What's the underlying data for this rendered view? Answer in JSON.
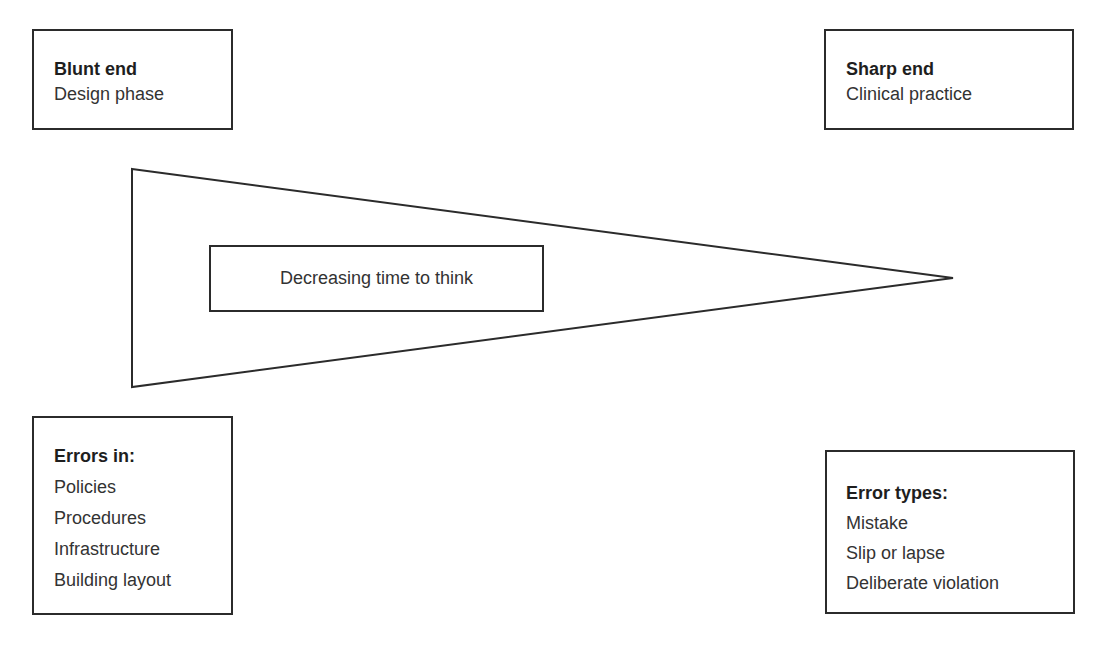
{
  "blunt_end": {
    "title": "Blunt end",
    "subtitle": "Design phase"
  },
  "sharp_end": {
    "title": "Sharp end",
    "subtitle": "Clinical practice"
  },
  "wedge": {
    "label": "Decreasing time to think"
  },
  "errors_in": {
    "title": "Errors in:",
    "items": [
      "Policies",
      "Procedures",
      "Infrastructure",
      "Building layout"
    ]
  },
  "error_types": {
    "title": "Error types:",
    "items": [
      "Mistake",
      "Slip or lapse",
      "Deliberate violation"
    ]
  },
  "colors": {
    "stroke": "#2b2b2b",
    "background": "#ffffff",
    "text": "#333333"
  }
}
